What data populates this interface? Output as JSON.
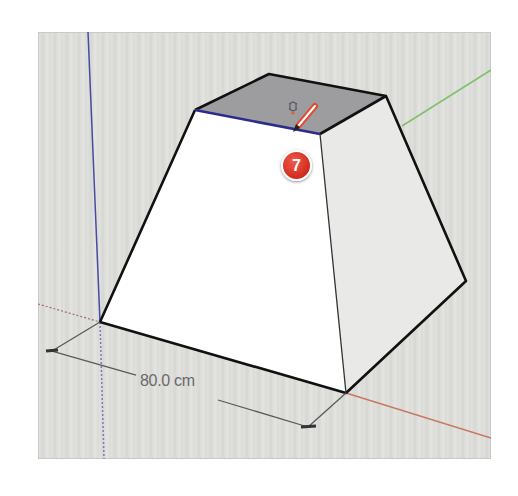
{
  "viewport": {
    "background_color": "#dcdcda",
    "axes": {
      "blue_axis_color": "#4a4aa0",
      "green_axis_color": "#7cc26a",
      "red_axis_color": "#c87860"
    }
  },
  "model": {
    "shape": "truncated-pyramid",
    "top_face_color": "#9d9d9f",
    "front_face_color": "#ffffff",
    "side_face_color": "#e9e9e7",
    "edge_color": "#111111",
    "selected_edge_color": "#2c2c8c"
  },
  "dimension": {
    "label": "80.0 cm"
  },
  "cursor": {
    "tool": "pencil-icon",
    "inference": "on-edge"
  },
  "step_badge": {
    "number": "7",
    "color": "#d93025"
  }
}
